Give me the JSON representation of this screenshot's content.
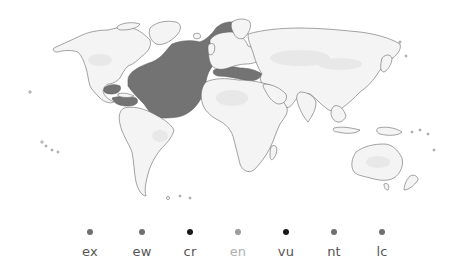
{
  "map": {
    "type": "species-range-world-map",
    "land_fill": "#f4f4f4",
    "land_shade": "#e6e6e6",
    "coast_stroke": "#666666",
    "range_fill": "#737373",
    "range_stroke": "#5e5e5e",
    "range_regions": [
      "North Atlantic",
      "Mediterranean Sea",
      "Gulf of Mexico",
      "Caribbean Sea"
    ]
  },
  "legend": {
    "items": [
      {
        "code": "ex",
        "color": "#707070",
        "label_color": "#555555"
      },
      {
        "code": "ew",
        "color": "#707070",
        "label_color": "#555555"
      },
      {
        "code": "cr",
        "color": "#1a1a1a",
        "label_color": "#555555"
      },
      {
        "code": "en",
        "color": "#9a9a9a",
        "label_color": "#b0b0b0"
      },
      {
        "code": "vu",
        "color": "#1a1a1a",
        "label_color": "#555555"
      },
      {
        "code": "nt",
        "color": "#707070",
        "label_color": "#555555"
      },
      {
        "code": "lc",
        "color": "#707070",
        "label_color": "#555555"
      }
    ]
  }
}
